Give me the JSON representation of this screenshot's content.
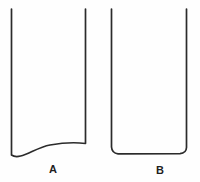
{
  "figure": {
    "background_color": "#fefefe",
    "stroke_color": "#2b2b2b",
    "stroke_width": 1.7,
    "width": 200,
    "height": 182,
    "panels": [
      {
        "id": "A",
        "label": "A",
        "label_x": 53,
        "label_y": 170,
        "left_wall_x": 11.5,
        "right_wall_x": 85.5,
        "top_y": 9,
        "left_wall_bottom_y": 155,
        "right_wall_bottom_y": 143,
        "bottom_profile": "asymmetric concave sweep rising from the low left corner up to the right wall",
        "path": "M 11.5 9 L 11.5 155 C 20 161 34 148 50 145 C 64 142.5 78 142.5 85.5 143.5 L 85.5 9"
      },
      {
        "id": "B",
        "label": "B",
        "label_x": 160,
        "label_y": 170,
        "left_wall_x": 111.5,
        "right_wall_x": 186.5,
        "top_y": 9,
        "left_wall_bottom_y": 148,
        "right_wall_bottom_y": 148,
        "bottom_profile": "nearly flat, gently sagging base with slightly rounded corners",
        "path": "M 111.5 9 L 111.5 147 C 111.8 151.2 114 153.4 118 153.8 L 180 153.6 C 184.2 153.3 186.3 151.4 186.5 147.5 L 186.5 9"
      }
    ]
  }
}
